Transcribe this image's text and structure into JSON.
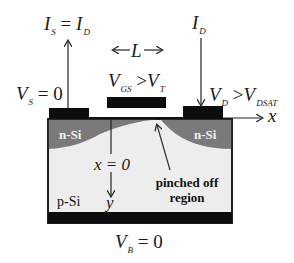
{
  "diagram": {
    "colors": {
      "background": "#ffffff",
      "contact": "#0d0d0d",
      "n_region": "#7a7a7a",
      "p_substrate": "#ededed",
      "outline": "#111111",
      "label_light": "#f2f2f2"
    },
    "labels": {
      "source_current": {
        "main": "I",
        "sub": "S",
        "eq": " = ",
        "main2": "I",
        "sub2": "D"
      },
      "drain_current": {
        "main": "I",
        "sub": "D"
      },
      "channel_length": {
        "left_arrow": "←",
        "text": "L",
        "right_arrow": "→"
      },
      "gate_voltage": {
        "main": "V",
        "sub": "GS",
        "op": " >",
        "main2": "V",
        "sub2": "T"
      },
      "source_voltage": {
        "main": "V",
        "sub": "S",
        "eq": " = 0"
      },
      "drain_voltage": {
        "main": "V",
        "sub": "D",
        "op": " >",
        "main2": "V",
        "sub2": "DSAT"
      },
      "x_axis": "x",
      "origin": "x = 0",
      "y_axis": "y",
      "n_si_left": "n-Si",
      "n_si_right": "n-Si",
      "p_si": "p-Si",
      "pinched_off_line1": "pinched off",
      "pinched_off_line2": "region",
      "body_voltage": {
        "main": "V",
        "sub": "B",
        "eq": " = 0"
      }
    },
    "nodes": [
      {
        "id": "source-contact",
        "type": "metal"
      },
      {
        "id": "gate",
        "type": "metal"
      },
      {
        "id": "drain-contact",
        "type": "metal"
      },
      {
        "id": "body-contact",
        "type": "metal"
      },
      {
        "id": "source-n-region",
        "type": "n-Si"
      },
      {
        "id": "drain-n-region",
        "type": "n-Si"
      },
      {
        "id": "substrate",
        "type": "p-Si"
      },
      {
        "id": "pinch-off-point",
        "type": "annotation"
      }
    ],
    "edges": [
      {
        "from": "source-contact",
        "to": "up",
        "label": "I_S = I_D"
      },
      {
        "from": "top",
        "to": "drain-contact",
        "label": "I_D"
      },
      {
        "from": "drain-contact",
        "to": "right",
        "label": "x"
      },
      {
        "from": "origin",
        "to": "down",
        "label": "y"
      },
      {
        "from": "pinched-off-label",
        "to": "pinch-off-point",
        "label": "pinched off region"
      }
    ]
  }
}
